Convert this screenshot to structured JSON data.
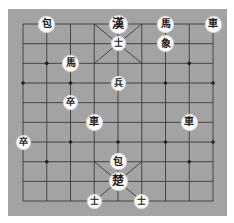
{
  "game": "Janggi",
  "board": {
    "files": 9,
    "ranks": 10,
    "background": "#a3a3a3",
    "line_color": "#3a3a3a"
  },
  "markers": [
    [
      1,
      2
    ],
    [
      7,
      2
    ],
    [
      0,
      3
    ],
    [
      2,
      3
    ],
    [
      4,
      3
    ],
    [
      6,
      3
    ],
    [
      8,
      3
    ],
    [
      0,
      6
    ],
    [
      2,
      6
    ],
    [
      4,
      6
    ],
    [
      6,
      6
    ],
    [
      8,
      6
    ],
    [
      1,
      7
    ],
    [
      7,
      7
    ]
  ],
  "pieces": [
    {
      "char": "包",
      "name": "cannon",
      "file": 1,
      "rank": 0,
      "kind": "normal"
    },
    {
      "char": "漢",
      "name": "general-han",
      "file": 4,
      "rank": 0,
      "kind": "general"
    },
    {
      "char": "馬",
      "name": "horse",
      "file": 6,
      "rank": 0,
      "kind": "normal"
    },
    {
      "char": "車",
      "name": "chariot",
      "file": 8,
      "rank": 0,
      "kind": "normal"
    },
    {
      "char": "士",
      "name": "guard",
      "file": 4,
      "rank": 1,
      "kind": "small"
    },
    {
      "char": "象",
      "name": "elephant",
      "file": 6,
      "rank": 1,
      "kind": "normal"
    },
    {
      "char": "馬",
      "name": "horse",
      "file": 2,
      "rank": 2,
      "kind": "normal"
    },
    {
      "char": "兵",
      "name": "soldier",
      "file": 4,
      "rank": 3,
      "kind": "small"
    },
    {
      "char": "卒",
      "name": "soldier",
      "file": 2,
      "rank": 4,
      "kind": "small"
    },
    {
      "char": "車",
      "name": "chariot",
      "file": 3,
      "rank": 5,
      "kind": "normal"
    },
    {
      "char": "車",
      "name": "chariot",
      "file": 7,
      "rank": 5,
      "kind": "normal"
    },
    {
      "char": "卒",
      "name": "soldier",
      "file": 0,
      "rank": 6,
      "kind": "small"
    },
    {
      "char": "包",
      "name": "cannon",
      "file": 4,
      "rank": 7,
      "kind": "normal"
    },
    {
      "char": "楚",
      "name": "general-cho",
      "file": 4,
      "rank": 8,
      "kind": "general"
    },
    {
      "char": "士",
      "name": "guard",
      "file": 3,
      "rank": 9,
      "kind": "small"
    },
    {
      "char": "士",
      "name": "guard",
      "file": 5,
      "rank": 9,
      "kind": "small"
    }
  ]
}
